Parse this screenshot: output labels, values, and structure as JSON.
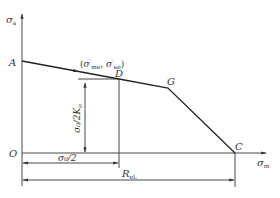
{
  "diagram": {
    "type": "Haigh fatigue diagram (simplified)",
    "axes": {
      "y_label_main": "σ",
      "y_label_sub": "a",
      "x_label_main": "σ",
      "x_label_sub": "m",
      "origin_label": "O"
    },
    "points": {
      "A": "A",
      "D": "D",
      "G": "G",
      "C": "C"
    },
    "working_point": {
      "open": "(",
      "s1": "σ",
      "s1_prime": "′",
      "s1_sub": "me",
      "sep": ", ",
      "s2": "σ",
      "s2_prime": "′",
      "s2_sub": "ae",
      "close": ")"
    },
    "dimensions": {
      "vertical": "σ₀/2K",
      "vertical_sub": "σ",
      "horizontal_half": "σ₀/2",
      "horizontal_full_main": "R",
      "horizontal_full_sub": "eL"
    },
    "colors": {
      "line": "#333333",
      "background": "#ffffff"
    }
  }
}
